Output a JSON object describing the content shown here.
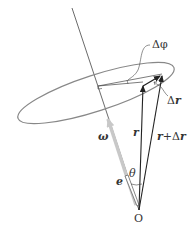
{
  "diagram": {
    "colors": {
      "line": "#333333",
      "ellipse": "#888888",
      "omega_arrow": "#c8c8c8",
      "background": "#ffffff"
    },
    "labels": {
      "delta_phi": "Δφ",
      "delta_r": "Δr",
      "r": "r",
      "r_plus_delta_r_r": "r",
      "r_plus_delta_r_plus": "+Δ",
      "r_plus_delta_r_r2": "r",
      "omega": "ω",
      "theta": "θ",
      "e": "e",
      "origin": "O"
    }
  }
}
